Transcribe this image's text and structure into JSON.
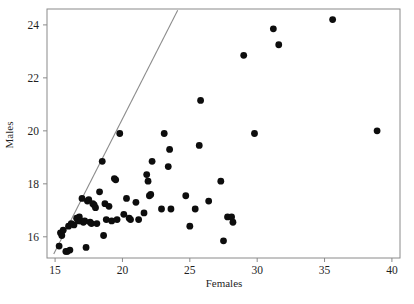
{
  "chart_data": {
    "type": "scatter",
    "title": "",
    "xlabel": "Females",
    "ylabel": "Males",
    "xlim": [
      14.4,
      40.6
    ],
    "ylim": [
      15.2,
      24.6
    ],
    "xticks": [
      15,
      20,
      25,
      30,
      35,
      40
    ],
    "yticks": [
      16,
      18,
      20,
      22,
      24
    ],
    "xtick_labels": [
      "15",
      "20",
      "25",
      "30",
      "35",
      "40"
    ],
    "ytick_labels": [
      "16",
      "18",
      "20",
      "22",
      "24"
    ],
    "grid": false,
    "legend": null,
    "series": [
      {
        "name": "observations",
        "marker": "filled-circle",
        "color": "#0d0d0d",
        "points": [
          [
            15.3,
            15.65
          ],
          [
            15.4,
            16.15
          ],
          [
            15.5,
            16.05
          ],
          [
            15.6,
            16.25
          ],
          [
            15.8,
            15.45
          ],
          [
            15.9,
            15.45
          ],
          [
            16.0,
            16.4
          ],
          [
            16.1,
            15.5
          ],
          [
            16.2,
            16.5
          ],
          [
            16.4,
            16.45
          ],
          [
            16.6,
            16.7
          ],
          [
            16.7,
            16.6
          ],
          [
            16.8,
            16.75
          ],
          [
            16.9,
            16.6
          ],
          [
            17.0,
            17.45
          ],
          [
            17.1,
            16.55
          ],
          [
            17.2,
            16.6
          ],
          [
            17.3,
            15.6
          ],
          [
            17.4,
            17.35
          ],
          [
            17.5,
            17.4
          ],
          [
            17.6,
            16.55
          ],
          [
            17.7,
            16.5
          ],
          [
            17.8,
            17.25
          ],
          [
            17.9,
            17.2
          ],
          [
            18.0,
            17.1
          ],
          [
            18.1,
            16.5
          ],
          [
            18.3,
            17.7
          ],
          [
            18.5,
            18.85
          ],
          [
            18.6,
            16.05
          ],
          [
            18.7,
            17.25
          ],
          [
            18.8,
            16.65
          ],
          [
            19.0,
            17.15
          ],
          [
            19.2,
            16.6
          ],
          [
            19.4,
            18.2
          ],
          [
            19.5,
            18.15
          ],
          [
            19.6,
            16.65
          ],
          [
            19.8,
            19.9
          ],
          [
            20.1,
            16.85
          ],
          [
            20.3,
            17.45
          ],
          [
            20.5,
            16.7
          ],
          [
            20.6,
            16.65
          ],
          [
            21.0,
            17.3
          ],
          [
            21.2,
            16.65
          ],
          [
            21.6,
            16.9
          ],
          [
            21.8,
            18.35
          ],
          [
            21.9,
            18.1
          ],
          [
            22.0,
            17.55
          ],
          [
            22.1,
            17.6
          ],
          [
            22.2,
            18.85
          ],
          [
            22.9,
            17.05
          ],
          [
            23.1,
            19.9
          ],
          [
            23.4,
            18.65
          ],
          [
            23.5,
            19.3
          ],
          [
            23.6,
            17.05
          ],
          [
            24.7,
            17.55
          ],
          [
            25.0,
            16.4
          ],
          [
            25.4,
            17.05
          ],
          [
            25.7,
            19.45
          ],
          [
            25.8,
            21.15
          ],
          [
            26.4,
            17.35
          ],
          [
            27.3,
            18.1
          ],
          [
            27.5,
            15.85
          ],
          [
            27.8,
            16.75
          ],
          [
            28.1,
            16.75
          ],
          [
            28.2,
            16.55
          ],
          [
            29.0,
            22.85
          ],
          [
            29.8,
            19.9
          ],
          [
            31.2,
            23.85
          ],
          [
            31.6,
            23.25
          ],
          [
            35.6,
            24.2
          ],
          [
            38.9,
            20.0
          ]
        ]
      }
    ],
    "annotations": [
      {
        "type": "line",
        "name": "diagonal-reference-line",
        "color": "#8c8c8c",
        "from": [
          14.9,
          15.35
        ],
        "to": [
          24.1,
          24.55
        ]
      }
    ]
  },
  "axes": {
    "x_title": "Females",
    "y_title": "Males"
  }
}
